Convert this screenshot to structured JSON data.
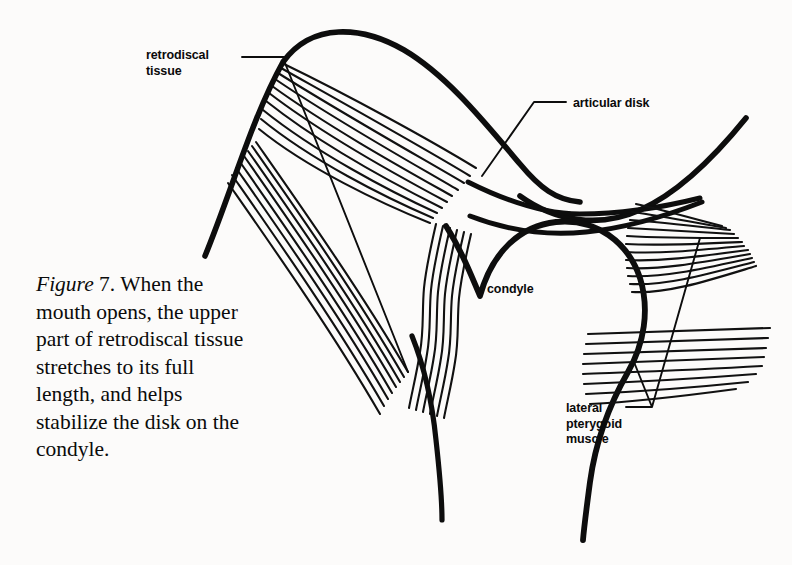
{
  "figure": {
    "domain": "anatomical-line-diagram",
    "background_color": "#fcfbfa",
    "ink_color": "#0a0a0a"
  },
  "caption": {
    "figure_word": "Figure",
    "number_and_text": " 7. When the mouth opens, the upper part of retrodiscal tissue stretches to its full length, and helps stabilize the disk on the condyle.",
    "full_text": "Figure 7. When the mouth opens, the upper part of retrodiscal tissue stretches to its full length, and helps stabilize the disk on the condyle.",
    "lines": [
      "Figure 7. When",
      "the mouth opens,",
      "the upper part",
      "of retrodiscal tis-",
      "sue stretches to",
      "its full length, and",
      "helps stabilize",
      "the disk on the",
      "condyle."
    ]
  },
  "labels": [
    {
      "id": "retrodiscal-tissue",
      "text": "retrodiscal\ntissue",
      "has_leader_line": true,
      "position": {
        "x": 146,
        "y": 48
      }
    },
    {
      "id": "articular-disk",
      "text": "articular disk",
      "has_leader_line": true,
      "position": {
        "x": 573,
        "y": 96
      }
    },
    {
      "id": "condyle",
      "text": "condyle",
      "has_leader_line": false,
      "position": {
        "x": 487,
        "y": 282
      }
    },
    {
      "id": "lateral-pterygoid-muscle",
      "text": "lateral\npterygoid\nmuscle",
      "has_leader_line": true,
      "position": {
        "x": 566,
        "y": 401
      }
    }
  ],
  "structures": [
    {
      "id": "glenoid-fossa-eminence",
      "description": "temporal bone outline, articular eminence and fossa"
    },
    {
      "id": "articular-disk-body",
      "description": "lens shaped disk between fossa and condyle"
    },
    {
      "id": "retrodiscal-tissue-upper-lamina",
      "description": "fan of straight fibers from posterior fossa wall to disk"
    },
    {
      "id": "retrodiscal-tissue-lower-lamina",
      "description": "wavy vertical fiber band to condylar neck"
    },
    {
      "id": "condyle-head",
      "description": "mandibular condyle and neck"
    },
    {
      "id": "lateral-pterygoid-superior-head",
      "description": "upper muscle belly fibers inserting on disk"
    },
    {
      "id": "lateral-pterygoid-inferior-head",
      "description": "lower muscle belly fibers inserting on condylar neck"
    }
  ]
}
